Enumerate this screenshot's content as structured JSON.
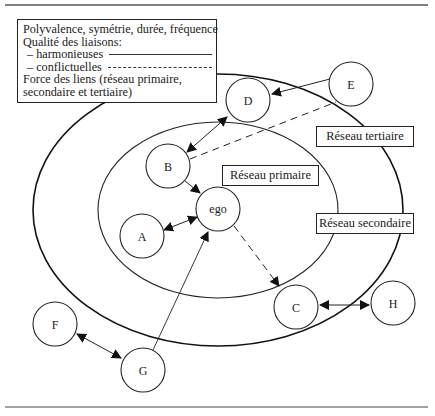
{
  "legend": {
    "line1": "Polyvalence, symétrie, durée, fréquence",
    "line2": "Qualité des liaisons:",
    "harmonious_label": "– harmonieuses",
    "conflict_label": "– conflictuelles",
    "line5": "Force des liens (réseau primaire,",
    "line6": "secondaire et tertiaire)"
  },
  "zones": {
    "primary": "Réseau primaire",
    "secondary": "Réseau secondaire",
    "tertiary": "Réseau tertiaire"
  },
  "nodes": {
    "ego": "ego",
    "A": "A",
    "B": "B",
    "C": "C",
    "D": "D",
    "E": "E",
    "F": "F",
    "G": "G",
    "H": "H"
  },
  "edges": [
    {
      "from": "A",
      "to": "ego",
      "style": "solid",
      "direction": "both"
    },
    {
      "from": "B",
      "to": "ego",
      "style": "solid",
      "direction": "forward"
    },
    {
      "from": "B",
      "to": "D",
      "style": "solid",
      "direction": "both"
    },
    {
      "from": "E",
      "to": "D",
      "style": "solid",
      "direction": "forward"
    },
    {
      "from": "B",
      "to": "E",
      "style": "dashed",
      "direction": "none"
    },
    {
      "from": "ego",
      "to": "C",
      "style": "dashed",
      "direction": "forward"
    },
    {
      "from": "C",
      "to": "H",
      "style": "solid",
      "direction": "both"
    },
    {
      "from": "G",
      "to": "ego",
      "style": "solid",
      "direction": "forward"
    },
    {
      "from": "F",
      "to": "G",
      "style": "solid",
      "direction": "both"
    }
  ]
}
